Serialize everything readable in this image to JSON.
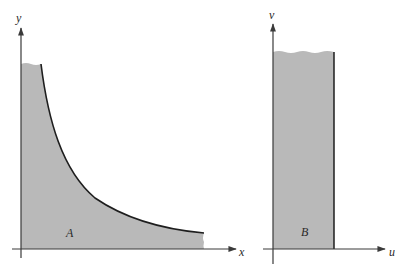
{
  "figure": {
    "left_panel": {
      "x_axis_label": "x",
      "y_axis_label": "y",
      "region_label": "A",
      "description": "Region under hyperbola-like curve y = c/x, bounded by x-axis and y-axis"
    },
    "right_panel": {
      "x_axis_label": "u",
      "y_axis_label": "v",
      "region_label": "B",
      "description": "Vertical strip (rectangle) bounded by v-axis and a vertical line"
    }
  },
  "colors": {
    "region_fill": "#b9b9b9",
    "axis": "#3a3a3a",
    "curve": "#1e1e1e",
    "background": "#ffffff"
  }
}
